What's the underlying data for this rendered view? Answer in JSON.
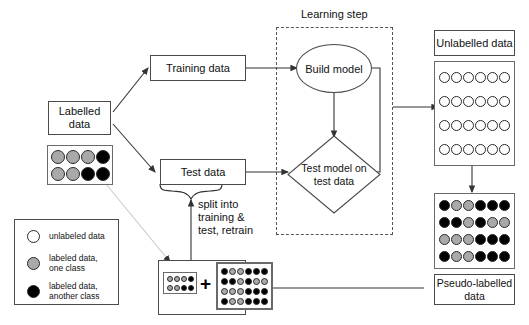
{
  "diagram": {
    "title_annotation": "Learning step",
    "colors": {
      "unlabeled": "#ffffff",
      "class_one": "#a9a9a9",
      "class_two": "#000000",
      "stroke": "#4a4a4a",
      "dashed_stroke": "#555555"
    },
    "nodes": {
      "labelled_data": "Labelled\ndata",
      "training_data": "Training data",
      "test_data": "Test data",
      "build_model": "Build model",
      "test_model": "Test model on\ntest data",
      "unlabelled_data": "Unlabelled data",
      "pseudo_labelled_data": "Pseudo-labelled\ndata"
    },
    "annotations": {
      "split_note": "split into\ntraining &\ntest, retrain",
      "plus_sign": "+"
    },
    "legend": {
      "items": [
        {
          "swatch": "unlabeled-dot",
          "color": "#ffffff",
          "label": "unlabeled data"
        },
        {
          "swatch": "class-one-dot",
          "color": "#a9a9a9",
          "label": "labeled data,\none class"
        },
        {
          "swatch": "class-two-dot",
          "color": "#000000",
          "label": "labeled data,\nanother class"
        }
      ]
    },
    "grids": {
      "labelled_sample": {
        "cols": 4,
        "rows": 2,
        "cells": [
          [
            "gray",
            "gray",
            "gray",
            "black"
          ],
          [
            "gray",
            "gray",
            "black",
            "black"
          ]
        ]
      },
      "unlabelled_pool": {
        "cols": 6,
        "rows": 4,
        "cells": [
          [
            "white",
            "white",
            "white",
            "white",
            "white",
            "white"
          ],
          [
            "white",
            "white",
            "white",
            "white",
            "white",
            "white"
          ],
          [
            "white",
            "white",
            "white",
            "white",
            "white",
            "white"
          ],
          [
            "white",
            "white",
            "white",
            "white",
            "white",
            "white"
          ]
        ]
      },
      "pseudo_labelled_pool": {
        "cols": 6,
        "rows": 4,
        "cells": [
          [
            "black",
            "gray",
            "gray",
            "black",
            "black",
            "black"
          ],
          [
            "black",
            "black",
            "gray",
            "black",
            "gray",
            "gray"
          ],
          [
            "gray",
            "gray",
            "gray",
            "black",
            "black",
            "black"
          ],
          [
            "black",
            "gray",
            "gray",
            "black",
            "black",
            "black"
          ]
        ]
      },
      "combined_small": {
        "cols": 4,
        "rows": 2,
        "cells": [
          [
            "gray",
            "gray",
            "gray",
            "black"
          ],
          [
            "gray",
            "gray",
            "black",
            "black"
          ]
        ]
      },
      "combined_large": {
        "cols": 6,
        "rows": 4,
        "cells": [
          [
            "black",
            "gray",
            "gray",
            "black",
            "black",
            "black"
          ],
          [
            "black",
            "black",
            "gray",
            "black",
            "gray",
            "gray"
          ],
          [
            "gray",
            "gray",
            "gray",
            "black",
            "black",
            "black"
          ],
          [
            "black",
            "gray",
            "gray",
            "black",
            "black",
            "black"
          ]
        ]
      }
    }
  }
}
